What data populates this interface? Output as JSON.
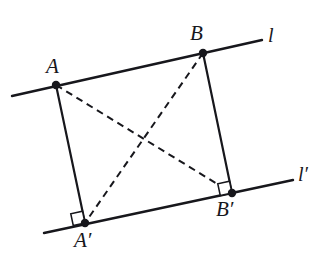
{
  "figure": {
    "background_color": "#ffffff",
    "stroke_color": "#17171c",
    "width": 330,
    "height": 277,
    "labels": {
      "point_a": "A",
      "point_b": "B",
      "point_a_prime": "A′",
      "point_b_prime": "B′",
      "line_l": "l",
      "line_l_prime": "l′"
    },
    "points": [
      {
        "name": "A",
        "label": "A",
        "x": 56,
        "y": 85,
        "label_x": 46,
        "label_y": 56,
        "on_line": "l"
      },
      {
        "name": "B",
        "label": "B",
        "x": 203,
        "y": 53,
        "label_x": 190,
        "label_y": 23,
        "on_line": "l"
      },
      {
        "name": "A'",
        "label": "A′",
        "x": 85,
        "y": 223,
        "label_x": 74,
        "label_y": 230,
        "on_line": "l'"
      },
      {
        "name": "B'",
        "label": "B′",
        "x": 232,
        "y": 193,
        "label_x": 216,
        "label_y": 199,
        "on_line": "l'"
      }
    ],
    "lines": [
      {
        "name": "l",
        "label": "l",
        "style": "solid",
        "x1": 12,
        "y1": 96,
        "x2": 262,
        "y2": 40,
        "label_x": 268,
        "label_y": 25,
        "width": 2.4
      },
      {
        "name": "l'",
        "label": "l′",
        "style": "solid",
        "x1": 44,
        "y1": 233,
        "x2": 293,
        "y2": 180,
        "label_x": 298,
        "label_y": 164,
        "width": 2.4
      }
    ],
    "segments": [
      {
        "name": "A-A'",
        "from": "A",
        "to": "A'",
        "style": "solid",
        "x1": 56,
        "y1": 85,
        "x2": 85,
        "y2": 223,
        "width": 2.2
      },
      {
        "name": "B-B'",
        "from": "B",
        "to": "B'",
        "style": "solid",
        "x1": 203,
        "y1": 53,
        "x2": 232,
        "y2": 193,
        "width": 2.2
      },
      {
        "name": "A-B'",
        "from": "A",
        "to": "B'",
        "style": "dashed",
        "x1": 56,
        "y1": 85,
        "x2": 232,
        "y2": 193,
        "width": 2.0
      },
      {
        "name": "B-A'",
        "from": "B",
        "to": "A'",
        "style": "dashed",
        "x1": 203,
        "y1": 53,
        "x2": 85,
        "y2": 223,
        "width": 2.0
      }
    ],
    "right_angles": [
      {
        "name": "right-angle-at-A-prime",
        "at": "A'",
        "vertex_x": 85,
        "vertex_y": 223,
        "size": 12
      },
      {
        "name": "right-angle-at-B-prime",
        "at": "B'",
        "vertex_x": 232,
        "vertex_y": 193,
        "size": 12
      }
    ],
    "dash_pattern": "7 5",
    "dot_radius": 4.2
  }
}
